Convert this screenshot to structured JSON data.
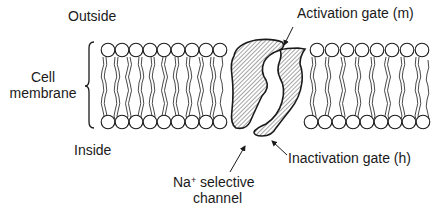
{
  "diagram": {
    "type": "voltage-gated sodium channel in lipid bilayer",
    "labels": {
      "outside": "Outside",
      "inside": "Inside",
      "cell_membrane_line1": "Cell",
      "cell_membrane_line2": "membrane",
      "activation_gate": "Activation gate (m)",
      "inactivation_gate": "Inactivation gate (h)",
      "channel_ion": "Na",
      "channel_ion_charge": "+",
      "channel_line1_rest": " selective",
      "channel_line2": "channel"
    },
    "colors": {
      "stroke": "#1a1a1a",
      "background": "#ffffff"
    }
  }
}
